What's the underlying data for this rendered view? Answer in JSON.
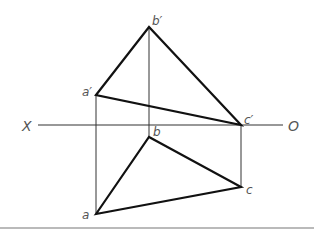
{
  "diagram": {
    "type": "orthographic projection of triangle ABC",
    "axis": {
      "left_label": "X",
      "right_label": "O"
    },
    "front_view": {
      "points": {
        "a_prime": {
          "label": "a′"
        },
        "b_prime": {
          "label": "b′"
        },
        "c_prime": {
          "label": "c′"
        }
      }
    },
    "top_view": {
      "points": {
        "a": {
          "label": "a"
        },
        "b": {
          "label": "b"
        },
        "c": {
          "label": "c"
        }
      }
    }
  }
}
